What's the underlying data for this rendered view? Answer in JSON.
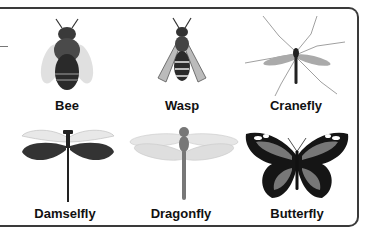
{
  "insects": [
    {
      "name": "Bee",
      "icon": "bee-icon"
    },
    {
      "name": "Wasp",
      "icon": "wasp-icon"
    },
    {
      "name": "Cranefly",
      "icon": "cranefly-icon"
    },
    {
      "name": "Damselfly",
      "icon": "damselfly-icon"
    },
    {
      "name": "Dragonfly",
      "icon": "dragonfly-icon"
    },
    {
      "name": "Butterfly",
      "icon": "butterfly-icon"
    }
  ]
}
